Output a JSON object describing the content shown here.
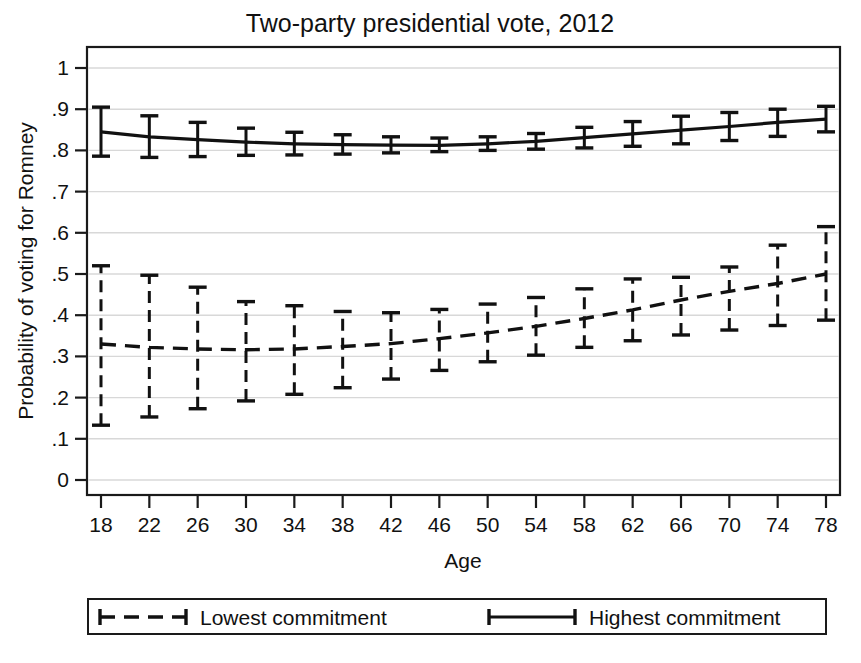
{
  "chart_data": {
    "type": "line",
    "title": "Two-party presidential vote, 2012",
    "xlabel": "Age",
    "ylabel": "Probability of voting for Romney",
    "grid": true,
    "legend_position": "below-outside",
    "xlim": [
      18,
      78
    ],
    "ylim": [
      0,
      1
    ],
    "xticks": [
      18,
      22,
      26,
      30,
      34,
      38,
      42,
      46,
      50,
      54,
      58,
      62,
      66,
      70,
      74,
      78
    ],
    "xtick_labels": [
      "18",
      "22",
      "26",
      "30",
      "34",
      "38",
      "42",
      "46",
      "50",
      "54",
      "58",
      "62",
      "66",
      "70",
      "74",
      "78"
    ],
    "yticks": [
      0,
      0.1,
      0.2,
      0.3,
      0.4,
      0.5,
      0.6,
      0.7,
      0.8,
      0.9,
      1
    ],
    "ytick_labels": [
      "0",
      ".1",
      ".2",
      ".3",
      ".4",
      ".5",
      ".6",
      ".7",
      ".8",
      ".9",
      "1"
    ],
    "x": [
      18,
      22,
      26,
      30,
      34,
      38,
      42,
      46,
      50,
      54,
      58,
      62,
      66,
      70,
      74,
      78
    ],
    "series": [
      {
        "name": "Lowest commitment",
        "style": "dashed",
        "color": "#111111",
        "values": [
          0.33,
          0.322,
          0.318,
          0.316,
          0.318,
          0.324,
          0.331,
          0.343,
          0.357,
          0.373,
          0.392,
          0.413,
          0.437,
          0.458,
          0.477,
          0.5
        ],
        "ci_low": [
          0.133,
          0.153,
          0.173,
          0.192,
          0.208,
          0.224,
          0.245,
          0.266,
          0.287,
          0.303,
          0.322,
          0.338,
          0.352,
          0.364,
          0.375,
          0.388
        ],
        "ci_high": [
          0.52,
          0.497,
          0.468,
          0.433,
          0.423,
          0.409,
          0.406,
          0.414,
          0.427,
          0.443,
          0.464,
          0.488,
          0.492,
          0.517,
          0.57,
          0.615
        ]
      },
      {
        "name": "Highest commitment",
        "style": "solid",
        "color": "#111111",
        "values": [
          0.845,
          0.833,
          0.826,
          0.82,
          0.816,
          0.814,
          0.813,
          0.812,
          0.816,
          0.822,
          0.831,
          0.84,
          0.849,
          0.858,
          0.868,
          0.876
        ],
        "ci_low": [
          0.786,
          0.783,
          0.785,
          0.788,
          0.789,
          0.791,
          0.794,
          0.797,
          0.8,
          0.803,
          0.806,
          0.81,
          0.816,
          0.824,
          0.834,
          0.845
        ],
        "ci_high": [
          0.905,
          0.884,
          0.868,
          0.854,
          0.844,
          0.838,
          0.833,
          0.83,
          0.833,
          0.841,
          0.856,
          0.87,
          0.883,
          0.892,
          0.9,
          0.907
        ]
      }
    ]
  },
  "legend": {
    "items": [
      {
        "label": "Lowest commitment",
        "style": "dashed"
      },
      {
        "label": "Highest commitment",
        "style": "solid"
      }
    ]
  }
}
